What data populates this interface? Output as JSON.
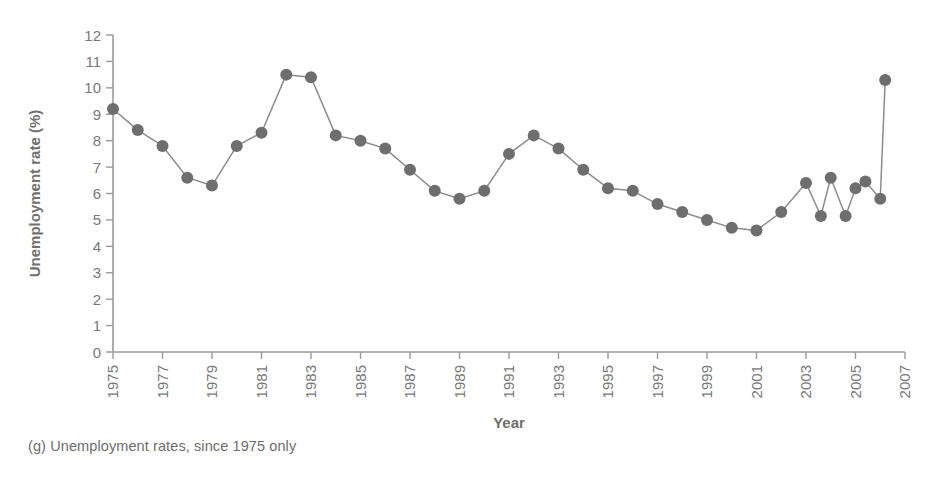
{
  "figure": {
    "caption": "(g) Unemployment rates, since 1975 only"
  },
  "colors": {
    "marker": "#6e6e6e",
    "line": "#8c8c8c",
    "axis": "#9a9a9a",
    "text": "#78787a"
  },
  "chart_data": {
    "type": "line",
    "title": "",
    "subtitle": "",
    "xlabel": "Year",
    "ylabel": "Unemployment rate (%)",
    "xlim": [
      1975,
      2007
    ],
    "ylim": [
      0,
      12
    ],
    "grid": false,
    "legend": "none",
    "xticks": [
      1975,
      1977,
      1979,
      1981,
      1983,
      1985,
      1987,
      1989,
      1991,
      1993,
      1995,
      1997,
      1999,
      2001,
      2003,
      2005,
      2007
    ],
    "xtick_labels": [
      "1975",
      "1977",
      "1979",
      "1981",
      "1983",
      "1985",
      "1987",
      "1989",
      "1991",
      "1993",
      "1995",
      "1997",
      "1999",
      "2001",
      "2003",
      "2005",
      "2007"
    ],
    "yticks": [
      0,
      1,
      2,
      3,
      4,
      5,
      6,
      7,
      8,
      9,
      10,
      11,
      12
    ],
    "ytick_labels": [
      "0",
      "1",
      "2",
      "3",
      "4",
      "5",
      "6",
      "7",
      "8",
      "9",
      "10",
      "11",
      "12"
    ],
    "x": [
      1975,
      1976,
      1977,
      1978,
      1979,
      1980,
      1981,
      1982,
      1983,
      1984,
      1985,
      1986,
      1987,
      1988,
      1989,
      1990,
      1991,
      1992,
      1993,
      1994,
      1995,
      1996,
      1997,
      1998,
      1999,
      2000,
      2001,
      2002,
      2003,
      2004,
      2005,
      2006
    ],
    "values": [
      9.2,
      8.4,
      7.8,
      6.6,
      6.3,
      7.8,
      8.3,
      10.5,
      10.4,
      8.2,
      8.0,
      7.7,
      6.9,
      6.1,
      5.8,
      6.1,
      7.5,
      8.2,
      7.7,
      6.9,
      6.2,
      6.1,
      5.6,
      5.3,
      5.0,
      4.7,
      4.6,
      5.3,
      6.4,
      6.6,
      6.2,
      5.8
    ],
    "markers": "filled-circle",
    "marker_size": 6,
    "series": [
      {
        "name": "Unemployment rate",
        "values": [
          9.2,
          8.4,
          7.8,
          6.6,
          6.3,
          7.8,
          8.3,
          10.5,
          10.4,
          8.2,
          8.0,
          7.7,
          6.9,
          6.1,
          5.8,
          6.1,
          7.5,
          8.2,
          7.7,
          6.9,
          6.2,
          6.1,
          5.6,
          5.3,
          5.0,
          4.7,
          4.6,
          5.3,
          6.4,
          6.6,
          6.2,
          5.8
        ]
      }
    ],
    "points": [
      {
        "x": 1975,
        "y": 9.2
      },
      {
        "x": 1976,
        "y": 8.4
      },
      {
        "x": 1977,
        "y": 7.8
      },
      {
        "x": 1978,
        "y": 6.6
      },
      {
        "x": 1979,
        "y": 6.3
      },
      {
        "x": 1980,
        "y": 7.8
      },
      {
        "x": 1981,
        "y": 8.3
      },
      {
        "x": 1982,
        "y": 10.5
      },
      {
        "x": 1983,
        "y": 10.4
      },
      {
        "x": 1984,
        "y": 8.2
      },
      {
        "x": 1985,
        "y": 8.0
      },
      {
        "x": 1986,
        "y": 7.7
      },
      {
        "x": 1987,
        "y": 6.9
      },
      {
        "x": 1988,
        "y": 6.1
      },
      {
        "x": 1989,
        "y": 5.8
      },
      {
        "x": 1990,
        "y": 6.1
      },
      {
        "x": 1991,
        "y": 7.5
      },
      {
        "x": 1992,
        "y": 8.2
      },
      {
        "x": 1993,
        "y": 7.7
      },
      {
        "x": 1994,
        "y": 6.9
      },
      {
        "x": 1995,
        "y": 6.2
      },
      {
        "x": 1996,
        "y": 6.1
      },
      {
        "x": 1997,
        "y": 5.6
      },
      {
        "x": 1998,
        "y": 5.3
      },
      {
        "x": 1999,
        "y": 5.0
      },
      {
        "x": 2000,
        "y": 4.7
      },
      {
        "x": 2001,
        "y": 4.6
      },
      {
        "x": 2002,
        "y": 5.3
      },
      {
        "x": 2003,
        "y": 6.4
      },
      {
        "x": 2004,
        "y": 6.6
      },
      {
        "x": 2005,
        "y": 6.2
      },
      {
        "x": 2006,
        "y": 5.8
      }
    ],
    "extra_points": [
      {
        "x": 2003.6,
        "y": 5.15
      },
      {
        "x": 2004.6,
        "y": 5.15
      },
      {
        "x": 2005.4,
        "y": 6.45
      },
      {
        "x": 2006.2,
        "y": 10.3
      }
    ]
  }
}
